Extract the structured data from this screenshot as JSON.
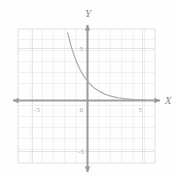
{
  "figure": {
    "kind": "cartesian-graph",
    "background_color": "#fefefe",
    "grid_color": "#e6e4e2",
    "grid_border_color": "#dedbd8",
    "axis_color": "#9b9b9b",
    "curve_color": "#b0aeac",
    "label_color": "#8c8c8c",
    "tick_color": "#a6a6a6"
  },
  "axes": {
    "x_label": "X",
    "y_label": "Y",
    "origin_label": "0",
    "x_ticks": [
      {
        "label": "-5",
        "value": -5
      },
      {
        "label": "5",
        "value": 5
      }
    ],
    "y_ticks": [
      {
        "label": "5",
        "value": 5
      },
      {
        "label": "-5",
        "value": -5
      }
    ],
    "xlim": [
      -7,
      7
    ],
    "ylim": [
      -7,
      7
    ],
    "grid": true,
    "grid_step": 1,
    "arrowheads": [
      "left",
      "right",
      "up",
      "down"
    ]
  },
  "chart_data": {
    "type": "line",
    "title": "",
    "xlabel": "X",
    "ylabel": "Y",
    "xlim": [
      -7,
      7
    ],
    "ylim": [
      -7,
      7
    ],
    "grid": true,
    "legend": "none",
    "series": [
      {
        "name": "exponential decay",
        "description": "decreasing exponential curve approaching the x-axis asymptotically from above",
        "x": [
          -2.6,
          -2.4,
          -2.2,
          -2.0,
          -1.8,
          -1.6,
          -1.4,
          -1.2,
          -1.0,
          -0.8,
          -0.6,
          -0.4,
          -0.2,
          0.0,
          0.25,
          0.5,
          0.75,
          1.0,
          1.25,
          1.5,
          1.75,
          2.0,
          2.5,
          3.0,
          3.5,
          4.0,
          4.5,
          5.0,
          5.5,
          6.0,
          6.5
        ],
        "y": [
          11.3,
          9.85,
          8.57,
          7.46,
          6.5,
          5.66,
          4.92,
          4.29,
          3.73,
          3.25,
          2.83,
          2.46,
          2.14,
          1.86,
          1.56,
          1.31,
          1.1,
          0.93,
          0.78,
          0.65,
          0.55,
          0.46,
          0.32,
          0.23,
          0.16,
          0.11,
          0.08,
          0.06,
          0.04,
          0.03,
          0.02
        ]
      }
    ]
  }
}
